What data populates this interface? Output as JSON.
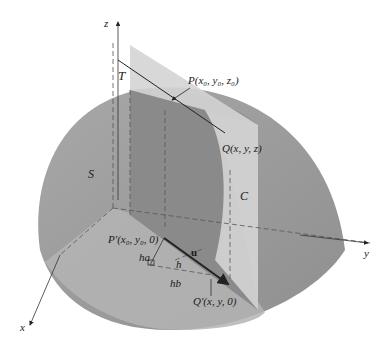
{
  "figure": {
    "axes": {
      "x": "x",
      "y": "y",
      "z": "z"
    },
    "surface_label": "S",
    "plane_label": "T",
    "curve_label": "C",
    "points": {
      "P": "P(x₀, y₀, z₀)",
      "Q": "Q(x, y, z)",
      "P_prime": "P′(x₀, y₀, 0)",
      "Q_prime": "Q′(x, y, 0)"
    },
    "vector_label": "u",
    "segments": {
      "ha": "ha",
      "h": "h",
      "hb": "hb"
    },
    "colors": {
      "surface": "#9a9a9a",
      "surface_light": "#b9b9b9",
      "plane": "#d2d2d2",
      "inner_dark": "#888888",
      "lines": "#333333"
    }
  }
}
